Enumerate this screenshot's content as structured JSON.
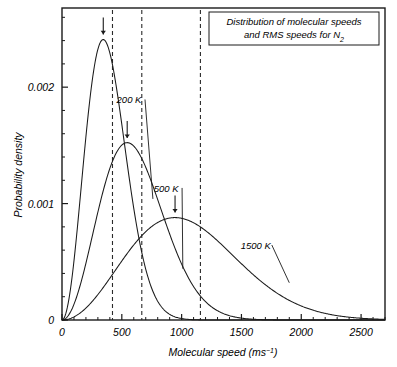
{
  "chart_data": {
    "type": "line",
    "title": "Distribution of molecular speeds and RMS speeds for N2",
    "title_lines": [
      "Distribution of molecular speeds",
      "and RMS speeds for N"
    ],
    "title_subscript": "2",
    "xlabel": "Molecular speed (ms",
    "xlabel_superscript": "−1",
    "xlabel_close": ")",
    "ylabel": "Probability density",
    "xlim": [
      0,
      2700
    ],
    "ylim": [
      0,
      0.00268
    ],
    "x_ticks": [
      0,
      500,
      1000,
      1500,
      2000,
      2500
    ],
    "x_tick_labels": [
      "0",
      "500",
      "1000",
      "1500",
      "2000",
      "2500"
    ],
    "x_minor_step": 100,
    "y_ticks": [
      0,
      0.001,
      0.002
    ],
    "y_tick_labels": [
      "0",
      "0.001",
      "0.002"
    ],
    "y_minor_step": 0.0002,
    "grid": false,
    "legend_position": "inline-annotations",
    "line_color": "#1a1a1a",
    "dash_color": "#2a2a2a",
    "frame_color": "#1a1a1a",
    "gas": "N2",
    "molar_mass_kg_per_mol": 0.028,
    "series": [
      {
        "name": "200 K",
        "temperature_K": 200,
        "peak_speed": 345,
        "peak_density": 0.00241,
        "rms_speed": 422,
        "arrow_x": 345,
        "label_x": 560,
        "label_y": 0.00186,
        "leader_to_x": 760,
        "leader_to_y": 0.00104
      },
      {
        "name": "500 K",
        "temperature_K": 500,
        "peak_speed": 545,
        "peak_density": 0.00152,
        "rms_speed": 667,
        "arrow_x": 545,
        "label_x": 870,
        "label_y": 0.0011,
        "leader_to_x": 1010,
        "leader_to_y": 0.00044
      },
      {
        "name": "1500 K",
        "temperature_K": 1500,
        "peak_speed": 945,
        "peak_density": 0.00088,
        "rms_speed": 1157,
        "arrow_x": 945,
        "label_x": 1620,
        "label_y": 0.00061,
        "leader_to_x": 1900,
        "leader_to_y": 0.00032
      }
    ],
    "rms_lines": [
      {
        "label": "RMS 200 K",
        "speed": 422
      },
      {
        "label": "RMS 500 K",
        "speed": 667
      },
      {
        "label": "RMS 1500 K",
        "speed": 1157
      }
    ]
  }
}
